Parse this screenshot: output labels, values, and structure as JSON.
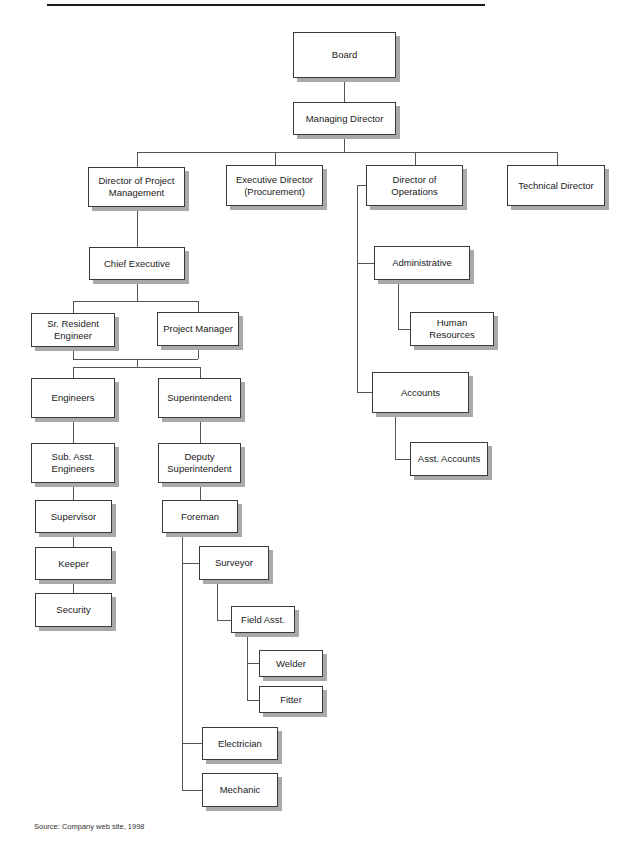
{
  "chart": {
    "header_rule": true,
    "colors": {
      "box_border": "#3a3a3a",
      "box_fill": "#ffffff",
      "box_shadow": "#a9a9a9",
      "connector": "#555555",
      "text": "#1a1a1a"
    },
    "nodes": {
      "board": "Board",
      "managing_director": "Managing Director",
      "director_project_management": "Director of Project\nManagement",
      "executive_director": "Executive Director\n(Procurement)",
      "director_operations": "Director of Operations",
      "technical_director": "Technical Director",
      "chief_executive": "Chief Executive",
      "sr_resident_engineer": "Sr. Resident\nEngineer",
      "project_manager": "Project Manager",
      "engineers": "Engineers",
      "superintendent": "Superintendent",
      "sub_asst_engineers": "Sub. Asst.\nEngineers",
      "deputy_superintendent": "Deputy\nSuperintendent",
      "supervisor": "Supervisor",
      "foreman": "Foreman",
      "keeper": "Keeper",
      "security": "Security",
      "surveyor": "Surveyor",
      "field_asst": "Field Asst.",
      "welder": "Welder",
      "fitter": "Fitter",
      "electrician": "Electrician",
      "mechanic": "Mechanic",
      "administrative": "Administrative",
      "human_resources": "Human Resources",
      "accounts": "Accounts",
      "asst_accounts": "Asst. Accounts"
    },
    "hierarchy": [
      {
        "parent": "Board",
        "children": [
          "Managing Director"
        ]
      },
      {
        "parent": "Managing Director",
        "children": [
          "Director of Project Management",
          "Executive Director (Procurement)",
          "Director of Operations",
          "Technical Director"
        ]
      },
      {
        "parent": "Director of Project Management",
        "children": [
          "Chief Executive"
        ]
      },
      {
        "parent": "Chief Executive",
        "children": [
          "Sr. Resident Engineer",
          "Project Manager"
        ]
      },
      {
        "parent": "Sr. Resident Engineer + Project Manager",
        "children": [
          "Engineers",
          "Superintendent"
        ]
      },
      {
        "parent": "Engineers",
        "children": [
          "Sub. Asst. Engineers"
        ]
      },
      {
        "parent": "Sub. Asst. Engineers",
        "children": [
          "Supervisor"
        ]
      },
      {
        "parent": "Supervisor",
        "children": [
          "Keeper"
        ]
      },
      {
        "parent": "Keeper",
        "children": [
          "Security"
        ]
      },
      {
        "parent": "Superintendent",
        "children": [
          "Deputy Superintendent"
        ]
      },
      {
        "parent": "Deputy Superintendent",
        "children": [
          "Foreman"
        ]
      },
      {
        "parent": "Foreman",
        "children": [
          "Surveyor",
          "Electrician",
          "Mechanic"
        ]
      },
      {
        "parent": "Surveyor",
        "children": [
          "Field Asst."
        ]
      },
      {
        "parent": "Field Asst.",
        "children": [
          "Welder",
          "Fitter"
        ]
      },
      {
        "parent": "Director of Operations",
        "children": [
          "Administrative",
          "Accounts"
        ]
      },
      {
        "parent": "Administrative",
        "children": [
          "Human Resources"
        ]
      },
      {
        "parent": "Accounts",
        "children": [
          "Asst. Accounts"
        ]
      }
    ],
    "source_note": "Source: Company web site, 1998"
  }
}
